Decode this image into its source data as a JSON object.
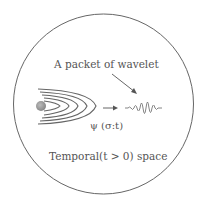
{
  "diagram": {
    "circle": {
      "cx": 103.5,
      "cy": 104,
      "r": 90,
      "stroke": "#666666"
    },
    "labels": {
      "packet": "A packet of wavelet",
      "psi": "ψ (σ:t)",
      "space": "Temporal(t > 0) space"
    },
    "colors": {
      "text": "#555555",
      "lines": "#666666",
      "wave": "#777777",
      "source": "#999999"
    }
  }
}
